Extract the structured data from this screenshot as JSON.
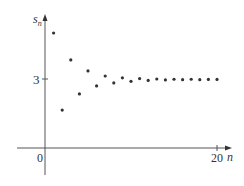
{
  "chart_data": {
    "type": "scatter",
    "title": "",
    "xlabel": "n",
    "ylabel": "s_n",
    "ylabel_main": "s",
    "ylabel_sub": "n",
    "x_ticks": [
      {
        "value": 0,
        "label": "0"
      },
      {
        "value": 20,
        "label": "20"
      }
    ],
    "y_ticks": [
      {
        "value": 3,
        "label": "3"
      }
    ],
    "xlim": [
      0,
      20
    ],
    "ylim": [
      0,
      5.5
    ],
    "grid": false,
    "series": [
      {
        "name": "s_n",
        "x": [
          1,
          2,
          3,
          4,
          5,
          6,
          7,
          8,
          9,
          10,
          11,
          12,
          13,
          14,
          15,
          16,
          17,
          18,
          19,
          20
        ],
        "y": [
          5.0,
          1.65,
          3.83,
          2.35,
          3.35,
          2.7,
          3.13,
          2.83,
          3.05,
          2.9,
          3.02,
          2.94,
          3.0,
          2.96,
          2.99,
          2.97,
          2.99,
          2.97,
          2.98,
          2.98
        ]
      }
    ]
  },
  "labels": {
    "origin": "0",
    "x_end": "20",
    "y_tick": "3",
    "x_axis": "n",
    "y_axis_main": "s",
    "y_axis_sub": "n"
  }
}
